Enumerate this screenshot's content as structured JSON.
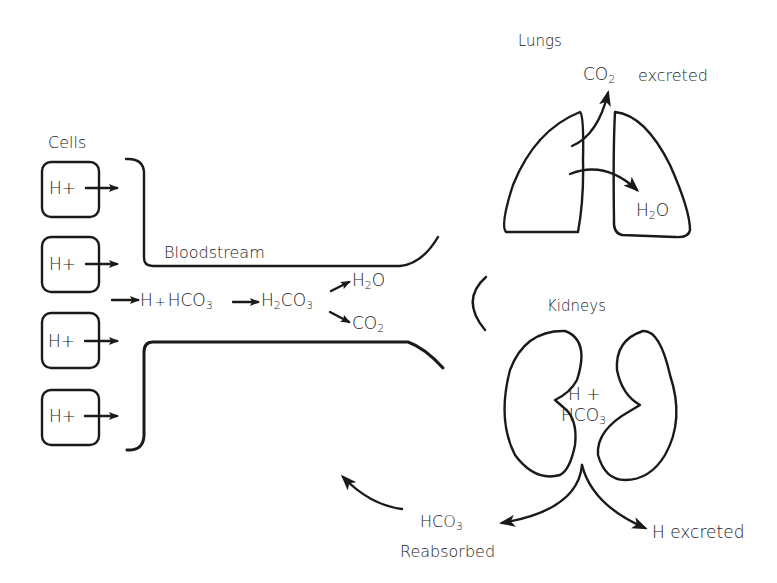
{
  "diagram": {
    "sections": {
      "cells": {
        "label": "Cells",
        "cell_boxes": [
          {
            "content": "H+"
          },
          {
            "content": "H+"
          },
          {
            "content": "H+"
          },
          {
            "content": "H+"
          }
        ]
      },
      "bloodstream": {
        "label": "Bloodstream",
        "reaction": {
          "reactant_h": "H",
          "plus": "+",
          "reactant_hco3_base": "HCO",
          "reactant_hco3_sub": "3",
          "intermediate_base_h": "H",
          "intermediate_sub_2": "2",
          "intermediate_base_co": "CO",
          "intermediate_sub_3": "3",
          "product_water_h": "H",
          "product_water_sub": "2",
          "product_water_o": "O",
          "product_co2_base": "CO",
          "product_co2_sub": "2"
        }
      },
      "lungs": {
        "label": "Lungs",
        "co2_base": "CO",
        "co2_sub": "2",
        "co2_status": "excreted",
        "water_h": "H",
        "water_sub": "2",
        "water_o": "O"
      },
      "kidneys": {
        "label": "Kidneys",
        "inner_line1": "H +",
        "inner_hco3_base": "HCO",
        "inner_hco3_sub": "3",
        "output_left_base": "HCO",
        "output_left_sub": "3",
        "output_left_status": "Reabsorbed",
        "output_right": "H excreted"
      }
    },
    "colors": {
      "line": "#1a1a1a",
      "background": "#ffffff"
    }
  }
}
